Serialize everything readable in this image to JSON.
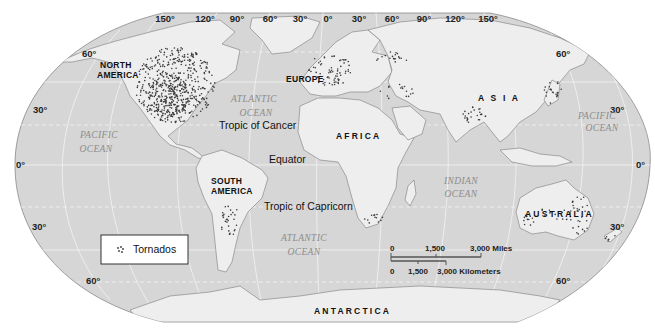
{
  "map": {
    "title": "World tornado distribution",
    "projection": "Robinson",
    "colors": {
      "ocean": "#d6d6d6",
      "land": "#eeeeee",
      "grid": "#f4f4f4",
      "dots": "#3a3a3a",
      "outline": "#8a8a8a"
    },
    "longitude_labels": [
      "150°",
      "120°",
      "90°",
      "60°",
      "30°",
      "0°",
      "30°",
      "60°",
      "90°",
      "120°",
      "150°"
    ],
    "latitude_labels": {
      "left": [
        "60°",
        "30°",
        "0°",
        "30°",
        "60°"
      ],
      "right": [
        "60°",
        "30°",
        "0°",
        "30°",
        "60°"
      ]
    },
    "continents": {
      "north_america_line1": "NORTH",
      "north_america_line2": "AMERICA",
      "south_america_line1": "SOUTH",
      "south_america_line2": "AMERICA",
      "europe": "EUROPE",
      "africa": "AFRICA",
      "asia": "A S I A",
      "australia": "AUSTRALIA",
      "antarctica": "ANTARCTICA"
    },
    "oceans": {
      "atlantic_north_1": "ATLANTIC",
      "atlantic_north_2": "OCEAN",
      "atlantic_south_1": "ATLANTIC",
      "atlantic_south_2": "OCEAN",
      "pacific_west_1": "PACIFIC",
      "pacific_west_2": "OCEAN",
      "pacific_east_1": "PACIFIC",
      "pacific_east_2": "OCEAN",
      "indian_1": "INDIAN",
      "indian_2": "OCEAN"
    },
    "reference_lines": {
      "tropic_cancer": "Tropic of Cancer",
      "equator": "Equator",
      "tropic_capricorn": "Tropic of Capricorn"
    },
    "legend": {
      "symbol": "dot-cluster",
      "label": "Tornados"
    },
    "scale_bar": {
      "miles_ticks": [
        "0",
        "1,500",
        "3,000 Miles"
      ],
      "km_ticks": [
        "0",
        "1,500",
        "3,000 Kilometers"
      ]
    },
    "tornado_clusters": [
      {
        "region": "North America",
        "cx": 175,
        "cy": 85,
        "rx": 40,
        "ry": 38,
        "count": 420,
        "seed": 11
      },
      {
        "region": "North America core",
        "cx": 170,
        "cy": 95,
        "rx": 22,
        "ry": 20,
        "count": 180,
        "seed": 12
      },
      {
        "region": "Europe",
        "cx": 330,
        "cy": 70,
        "rx": 22,
        "ry": 16,
        "count": 70,
        "seed": 21
      },
      {
        "region": "Eastern Europe / Russia",
        "cx": 392,
        "cy": 58,
        "rx": 18,
        "ry": 6,
        "count": 18,
        "seed": 22
      },
      {
        "region": "Turkey-Caspian",
        "cx": 395,
        "cy": 92,
        "rx": 20,
        "ry": 8,
        "count": 16,
        "seed": 23
      },
      {
        "region": "South Asia (Bangladesh)",
        "cx": 475,
        "cy": 115,
        "rx": 12,
        "ry": 9,
        "count": 26,
        "seed": 31
      },
      {
        "region": "Japan",
        "cx": 553,
        "cy": 92,
        "rx": 9,
        "ry": 12,
        "count": 22,
        "seed": 32
      },
      {
        "region": "South America",
        "cx": 230,
        "cy": 220,
        "rx": 10,
        "ry": 16,
        "count": 30,
        "seed": 41
      },
      {
        "region": "Southern Africa",
        "cx": 373,
        "cy": 219,
        "rx": 10,
        "ry": 5,
        "count": 12,
        "seed": 42
      },
      {
        "region": "Australia east",
        "cx": 580,
        "cy": 215,
        "rx": 10,
        "ry": 20,
        "count": 30,
        "seed": 51
      },
      {
        "region": "Australia west",
        "cx": 528,
        "cy": 220,
        "rx": 6,
        "ry": 6,
        "count": 10,
        "seed": 52
      },
      {
        "region": "Australia interior",
        "cx": 555,
        "cy": 212,
        "rx": 18,
        "ry": 10,
        "count": 12,
        "seed": 53
      },
      {
        "region": "New Zealand",
        "cx": 612,
        "cy": 238,
        "rx": 7,
        "ry": 4,
        "count": 5,
        "seed": 54
      }
    ]
  }
}
